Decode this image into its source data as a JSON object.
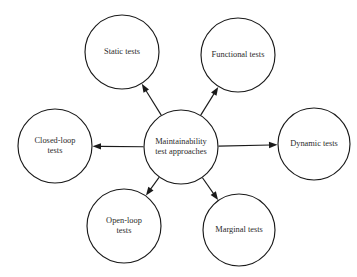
{
  "diagram": {
    "type": "hub-and-spoke",
    "title": "",
    "background_color": "#ffffff",
    "stroke_color": "#1a1a1a",
    "text_color": "#2b2b2b",
    "center": {
      "id": "maintainability-test-approaches",
      "lines": [
        "Maintainability",
        "test approaches"
      ],
      "cx": 181,
      "cy": 147,
      "r": 37
    },
    "nodes": [
      {
        "id": "static-tests",
        "lines": [
          "Static tests"
        ],
        "cx": 122,
        "cy": 52,
        "r": 37,
        "direction": "up-left"
      },
      {
        "id": "functional-tests",
        "lines": [
          "Functional tests"
        ],
        "cx": 238,
        "cy": 55,
        "r": 37,
        "direction": "up-right"
      },
      {
        "id": "closed-loop-tests",
        "lines": [
          "Closed-loop",
          "tests"
        ],
        "cx": 55,
        "cy": 146,
        "r": 37,
        "direction": "left"
      },
      {
        "id": "dynamic-tests",
        "lines": [
          "Dynamic tests"
        ],
        "cx": 314,
        "cy": 144,
        "r": 36,
        "direction": "right"
      },
      {
        "id": "open-loop-tests",
        "lines": [
          "Open-loop",
          "tests"
        ],
        "cx": 124,
        "cy": 226,
        "r": 37,
        "direction": "down-left"
      },
      {
        "id": "marginal-tests",
        "lines": [
          "Marginal tests"
        ],
        "cx": 239,
        "cy": 230,
        "r": 36,
        "direction": "down-right"
      }
    ],
    "edges": [
      {
        "from": "maintainability-test-approaches",
        "to": "static-tests",
        "arrow": "to"
      },
      {
        "from": "maintainability-test-approaches",
        "to": "functional-tests",
        "arrow": "to"
      },
      {
        "from": "maintainability-test-approaches",
        "to": "closed-loop-tests",
        "arrow": "to"
      },
      {
        "from": "maintainability-test-approaches",
        "to": "dynamic-tests",
        "arrow": "to"
      },
      {
        "from": "maintainability-test-approaches",
        "to": "open-loop-tests",
        "arrow": "to"
      },
      {
        "from": "maintainability-test-approaches",
        "to": "marginal-tests",
        "arrow": "to"
      }
    ]
  }
}
